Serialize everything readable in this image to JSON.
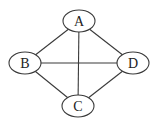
{
  "diagram": {
    "type": "undirected-graph",
    "nodes": [
      {
        "id": "A",
        "label": "A",
        "cx": 79,
        "cy": 21,
        "rx": 16,
        "ry": 11
      },
      {
        "id": "B",
        "label": "B",
        "cx": 25,
        "cy": 63,
        "rx": 16,
        "ry": 11
      },
      {
        "id": "C",
        "label": "C",
        "cx": 78,
        "cy": 106,
        "rx": 16,
        "ry": 11
      },
      {
        "id": "D",
        "label": "D",
        "cx": 133,
        "cy": 63,
        "rx": 16,
        "ry": 11
      }
    ],
    "edges": [
      {
        "from": "A",
        "to": "B"
      },
      {
        "from": "A",
        "to": "D"
      },
      {
        "from": "A",
        "to": "C"
      },
      {
        "from": "B",
        "to": "D"
      },
      {
        "from": "B",
        "to": "C"
      },
      {
        "from": "D",
        "to": "C"
      }
    ],
    "colors": {
      "stroke": "#3a3a3a",
      "fill": "#ffffff",
      "text": "#222222"
    }
  }
}
